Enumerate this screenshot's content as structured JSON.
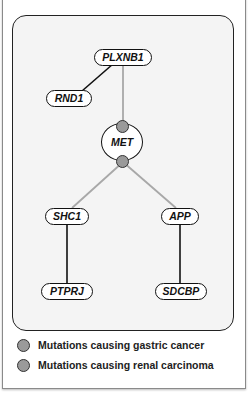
{
  "diagram": {
    "nodes": {
      "plxnb1": "PLXNB1",
      "rnd1": "RND1",
      "met": "MET",
      "shc1": "SHC1",
      "app": "APP",
      "ptprj": "PTPRJ",
      "sdcbp": "SDCBP"
    },
    "edges": [
      {
        "from": "PLXNB1",
        "to": "RND1",
        "style": "black"
      },
      {
        "from": "PLXNB1",
        "to": "MET",
        "style": "gray"
      },
      {
        "from": "MET",
        "to": "SHC1",
        "style": "gray"
      },
      {
        "from": "MET",
        "to": "APP",
        "style": "gray"
      },
      {
        "from": "SHC1",
        "to": "PTPRJ",
        "style": "black"
      },
      {
        "from": "APP",
        "to": "SDCBP",
        "style": "black"
      }
    ],
    "mutation_sites": [
      {
        "node": "MET",
        "position": "top"
      },
      {
        "node": "MET",
        "position": "bottom"
      }
    ]
  },
  "legend": {
    "items": [
      {
        "label": "Mutations causing gastric cancer",
        "color": "#9a9a9a"
      },
      {
        "label": "Mutations causing renal carcinoma",
        "color": "#9a9a9a"
      }
    ]
  },
  "colors": {
    "gray_edge": "#a8a8a8",
    "black_edge": "#111111",
    "panel_bg": "#f4f4f4",
    "mutation_dot": "#9a9a9a"
  }
}
